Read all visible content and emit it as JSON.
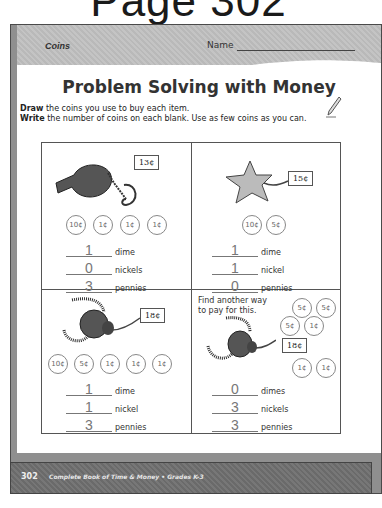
{
  "page_title": "Page 302",
  "header": {
    "section": "Coins",
    "name_label": "Name"
  },
  "heading": "Problem Solving with Money",
  "instructions": [
    {
      "bold": "Draw",
      "text": " the coins you use to buy each item."
    },
    {
      "bold": "Write",
      "text": " the number of coins on each blank. Use as few coins as you can."
    }
  ],
  "problems": [
    {
      "item": "whistle-icon",
      "price": "13¢",
      "coins": [
        "10¢",
        "1¢",
        "1¢",
        "1¢"
      ],
      "answers": [
        {
          "value": "1",
          "label": "dime"
        },
        {
          "value": "0",
          "label": "nickels"
        },
        {
          "value": "3",
          "label": "pennies"
        }
      ]
    },
    {
      "item": "starfish-icon",
      "price": "15¢",
      "coins": [
        "10¢",
        "5¢"
      ],
      "answers": [
        {
          "value": "1",
          "label": "dime"
        },
        {
          "value": "1",
          "label": "nickel"
        },
        {
          "value": "0",
          "label": "pennies"
        }
      ]
    },
    {
      "item": "caterpillar-icon",
      "price": "18¢",
      "coins": [
        "10¢",
        "5¢",
        "1¢",
        "1¢",
        "1¢"
      ],
      "answers": [
        {
          "value": "1",
          "label": "dime"
        },
        {
          "value": "1",
          "label": "nickel"
        },
        {
          "value": "3",
          "label": "pennies"
        }
      ]
    },
    {
      "item": "caterpillar-icon",
      "prompt_line1": "Find another way",
      "prompt_line2": "to pay for this.",
      "price": "18¢",
      "coins": [
        "5¢",
        "5¢",
        "5¢",
        "1¢",
        "1¢",
        "1¢"
      ],
      "answers": [
        {
          "value": "0",
          "label": "dimes"
        },
        {
          "value": "3",
          "label": "nickels"
        },
        {
          "value": "3",
          "label": "pennies"
        }
      ]
    }
  ],
  "footer": {
    "page_number": "302",
    "book": "Complete Book of Time & Money  •  Grades K-3"
  }
}
